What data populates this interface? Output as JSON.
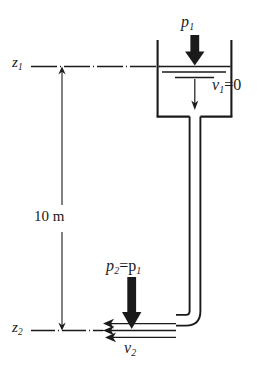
{
  "figure": {
    "ink_color": "#1a1a1a",
    "background_color": "#ffffff"
  },
  "labels": {
    "z1": {
      "symbol": "z",
      "subscript": "1",
      "text": "z1"
    },
    "z2": {
      "symbol": "z",
      "subscript": "2",
      "text": "z2"
    },
    "p1": {
      "symbol": "p",
      "subscript": "1",
      "text": "p1"
    },
    "v1": {
      "symbol": "v",
      "subscript": "1",
      "suffix": "=0",
      "text": "v1=0"
    },
    "p2": {
      "symbol": "p",
      "subscript": "2",
      "suffix": "=p",
      "suffix_subscript": "1",
      "text": "p2=p1"
    },
    "v2": {
      "symbol": "v",
      "subscript": "2",
      "text": "v2"
    },
    "height": {
      "value": "10",
      "unit": "m",
      "text": "10 m"
    }
  },
  "icons": {
    "pressure_arrow_top": "down-arrow-icon",
    "pressure_arrow_bottom": "down-arrow-icon",
    "flow_arrow_tank": "small-down-arrow-icon",
    "jet_arrows": "left-arrow-icon",
    "dimension_arrow_up": "up-arrow-icon",
    "dimension_arrow_down": "down-arrow-icon"
  },
  "geometry": {
    "tank_left": 157,
    "tank_right": 232,
    "tank_top": 40,
    "tank_bottom": 117,
    "pipe_left": 189,
    "pipe_right": 200,
    "water_surface_y": 66,
    "datum_z1_y": 66,
    "datum_z2_y": 330,
    "dimension_x": 62
  }
}
